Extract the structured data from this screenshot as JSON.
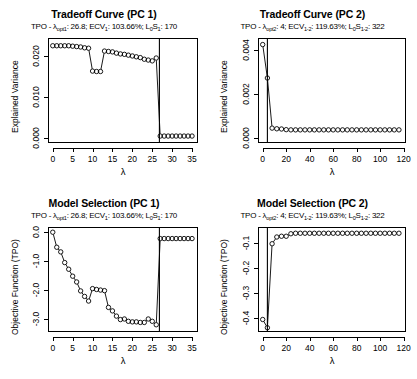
{
  "figure": {
    "lambda_symbol": "λ",
    "panels": [
      "tradeoff_pc1",
      "tradeoff_pc2",
      "modelsel_pc1",
      "modelsel_pc2"
    ]
  },
  "tradeoff_pc1": {
    "title": "Tradeoff Curve (PC 1)",
    "subtitle_prefix": "TPO - ",
    "subtitle_lambda": "λ",
    "subtitle_lambda_sub": "opt1",
    "subtitle_lambda_val": ": 26.8; ECV",
    "subtitle_ecv_sub": "1",
    "subtitle_ecv_val": ": 103.66%; L",
    "subtitle_l0_sub": "0",
    "subtitle_s": "S",
    "subtitle_s_sub": "1",
    "subtitle_tail": ": 170",
    "ylabel": "Explained Variance",
    "xlabel": "λ"
  },
  "tradeoff_pc2": {
    "title": "Tradeoff Curve (PC 2)",
    "subtitle_prefix": "TPO - ",
    "subtitle_lambda": "λ",
    "subtitle_lambda_sub": "opt2",
    "subtitle_lambda_val": ": 4; ECV",
    "subtitle_ecv_sub": "1-2",
    "subtitle_ecv_val": ": 119.63%; L",
    "subtitle_l0_sub": "0",
    "subtitle_s": "S",
    "subtitle_s_sub": "1-2",
    "subtitle_tail": ": 322",
    "ylabel": "Explained Variance",
    "xlabel": "λ"
  },
  "modelsel_pc1": {
    "title": "Model Selection (PC 1)",
    "subtitle_prefix": "TPO - ",
    "subtitle_lambda": "λ",
    "subtitle_lambda_sub": "opt1",
    "subtitle_lambda_val": ": 26.8; ECV",
    "subtitle_ecv_sub": "1",
    "subtitle_ecv_val": ": 103.66%; L",
    "subtitle_l0_sub": "0",
    "subtitle_s": "S",
    "subtitle_s_sub": "1",
    "subtitle_tail": ": 170",
    "ylabel": "Objective Function (TPO)",
    "xlabel": "λ"
  },
  "modelsel_pc2": {
    "title": "Model Selection (PC 2)",
    "subtitle_prefix": "TPO - ",
    "subtitle_lambda": "λ",
    "subtitle_lambda_sub": "opt2",
    "subtitle_lambda_val": ": 4; ECV",
    "subtitle_ecv_sub": "1-2",
    "subtitle_ecv_val": ": 119.63%; L",
    "subtitle_l0_sub": "0",
    "subtitle_s": "S",
    "subtitle_s_sub": "1-2",
    "subtitle_tail": ": 322",
    "ylabel": "Objective Function (TPO)",
    "xlabel": "λ"
  },
  "chart_data": [
    {
      "id": "tradeoff_pc1",
      "type": "scatter",
      "title": "Tradeoff Curve (PC 1)",
      "subtitle": "TPO - λopt1: 26.8; ECV1: 103.66%; L0S1: 170",
      "xlabel": "λ",
      "ylabel": "Explained Variance",
      "xlim": [
        -1.2,
        36.5
      ],
      "ylim": [
        -0.0012,
        0.0245
      ],
      "xticks": [
        0,
        5,
        10,
        15,
        20,
        25,
        30,
        35
      ],
      "yticks": [
        0.0,
        0.01,
        0.02
      ],
      "ytick_labels": [
        "0.000",
        "0.010",
        "0.020"
      ],
      "grid": false,
      "legend": "none",
      "vline_x": 26.8,
      "marker": "open-circle",
      "x": [
        0,
        1,
        2,
        3,
        4,
        5,
        6,
        7,
        8,
        9,
        10,
        11,
        12,
        13,
        14,
        15,
        16,
        17,
        18,
        19,
        20,
        21,
        22,
        23,
        24,
        25,
        26,
        27,
        28,
        29,
        30,
        31,
        32,
        33,
        34,
        35
      ],
      "y": [
        0.0226,
        0.0226,
        0.0226,
        0.0226,
        0.0226,
        0.0225,
        0.0224,
        0.0223,
        0.0221,
        0.022,
        0.0164,
        0.0163,
        0.0163,
        0.0213,
        0.0212,
        0.0211,
        0.0208,
        0.0206,
        0.0205,
        0.0203,
        0.0201,
        0.0199,
        0.0197,
        0.0193,
        0.0191,
        0.0189,
        0.0196,
        0.0005,
        0.0005,
        0.0005,
        0.0005,
        0.0005,
        0.0005,
        0.0005,
        0.0005,
        0.0005
      ]
    },
    {
      "id": "tradeoff_pc2",
      "type": "scatter",
      "title": "Tradeoff Curve (PC 2)",
      "subtitle": "TPO - λopt2: 4; ECV1-2: 119.63%; L0S1-2: 322",
      "xlabel": "λ",
      "ylabel": "Explained Variance",
      "xlim": [
        -4,
        122
      ],
      "ylim": [
        -0.00025,
        0.00455
      ],
      "xticks": [
        0,
        20,
        40,
        60,
        80,
        100,
        120
      ],
      "yticks": [
        0.0,
        0.002,
        0.004
      ],
      "ytick_labels": [
        "0.000",
        "0.002",
        "0.004"
      ],
      "grid": false,
      "legend": "none",
      "vline_x": 4,
      "marker": "open-circle",
      "x": [
        0,
        4,
        8,
        12,
        16,
        20,
        24,
        28,
        32,
        36,
        40,
        44,
        48,
        52,
        56,
        60,
        64,
        68,
        72,
        76,
        80,
        84,
        88,
        92,
        96,
        100,
        104,
        108,
        112,
        116
      ],
      "y": [
        0.00425,
        0.00272,
        0.00043,
        0.0004,
        0.00039,
        0.00036,
        0.00035,
        0.00035,
        0.00035,
        0.00035,
        0.00035,
        0.00035,
        0.00035,
        0.00035,
        0.00035,
        0.00035,
        0.00035,
        0.00035,
        0.00035,
        0.00035,
        0.00035,
        0.00035,
        0.00035,
        0.00035,
        0.00035,
        0.00035,
        0.00035,
        0.00035,
        0.00035,
        0.00035
      ]
    },
    {
      "id": "modelsel_pc1",
      "type": "scatter",
      "title": "Model Selection (PC 1)",
      "subtitle": "TPO - λopt1: 26.8; ECV1: 103.66%; L0S1: 170",
      "xlabel": "λ",
      "ylabel": "Objective Function (TPO)",
      "xlim": [
        -1.2,
        36.5
      ],
      "ylim": [
        -3.45,
        0.18
      ],
      "xticks": [
        0,
        5,
        10,
        15,
        20,
        25,
        30,
        35
      ],
      "yticks": [
        0.0,
        -1.0,
        -2.0,
        -3.0
      ],
      "ytick_labels": [
        "0.0",
        "-1.0",
        "-2.0",
        "-3.0"
      ],
      "grid": false,
      "legend": "none",
      "vline_x": 26.8,
      "marker": "open-circle",
      "x": [
        0,
        1,
        2,
        3,
        4,
        5,
        6,
        7,
        8,
        9,
        10,
        11,
        12,
        13,
        14,
        15,
        16,
        17,
        18,
        19,
        20,
        21,
        22,
        23,
        24,
        25,
        26,
        27,
        28,
        29,
        30,
        31,
        32,
        33,
        34,
        35
      ],
      "y": [
        0.0,
        -0.52,
        -0.68,
        -1.05,
        -1.28,
        -1.52,
        -1.72,
        -2.03,
        -2.22,
        -2.38,
        -1.95,
        -1.98,
        -2.0,
        -2.02,
        -2.6,
        -2.72,
        -2.9,
        -3.02,
        -3.0,
        -3.08,
        -3.1,
        -3.1,
        -3.12,
        -3.12,
        -3.0,
        -3.08,
        -3.2,
        -0.22,
        -0.22,
        -0.22,
        -0.22,
        -0.22,
        -0.22,
        -0.22,
        -0.22,
        -0.22
      ]
    },
    {
      "id": "modelsel_pc2",
      "type": "scatter",
      "title": "Model Selection (PC 2)",
      "subtitle": "TPO - λopt2: 4; ECV1-2: 119.63%; L0S1-2: 322",
      "xlabel": "λ",
      "ylabel": "Objective Function (TPO)",
      "xlim": [
        -4,
        122
      ],
      "ylim": [
        -0.455,
        -0.035
      ],
      "xticks": [
        0,
        20,
        40,
        60,
        80,
        100,
        120
      ],
      "yticks": [
        -0.1,
        -0.2,
        -0.3,
        -0.4
      ],
      "ytick_labels": [
        "-0.1",
        "-0.2",
        "-0.3",
        "-0.4"
      ],
      "grid": false,
      "legend": "none",
      "vline_x": 4,
      "marker": "open-circle",
      "x": [
        0,
        4,
        8,
        12,
        16,
        20,
        24,
        28,
        32,
        36,
        40,
        44,
        48,
        52,
        56,
        60,
        64,
        68,
        72,
        76,
        80,
        84,
        88,
        92,
        96,
        100,
        104,
        108,
        112,
        116
      ],
      "y": [
        -0.405,
        -0.438,
        -0.102,
        -0.075,
        -0.072,
        -0.072,
        -0.062,
        -0.06,
        -0.06,
        -0.06,
        -0.06,
        -0.06,
        -0.06,
        -0.06,
        -0.06,
        -0.06,
        -0.06,
        -0.06,
        -0.06,
        -0.06,
        -0.06,
        -0.06,
        -0.06,
        -0.06,
        -0.06,
        -0.06,
        -0.06,
        -0.06,
        -0.06,
        -0.06
      ]
    }
  ]
}
